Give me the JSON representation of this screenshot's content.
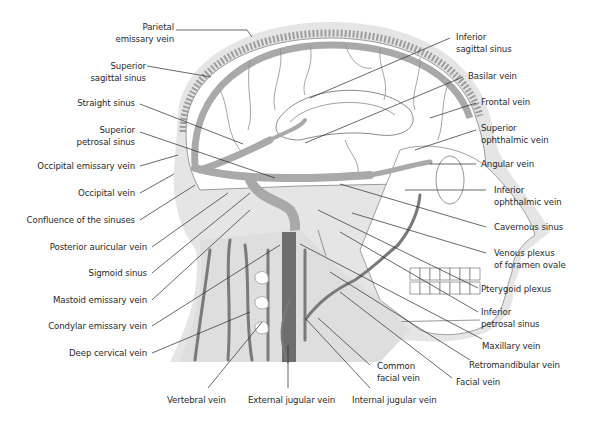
{
  "figure": {
    "colors": {
      "background": "#ffffff",
      "skin_shadow": "#e3e3e3",
      "sinus_gray": "#a9a9a9",
      "dark_vein": "#6e6e6e",
      "leader_line": "#2a2a2a",
      "text": "#2a2a2a"
    }
  },
  "labels_left": [
    {
      "id": "parietal-emissary-vein",
      "lines": [
        "Parietal",
        "emissary vein"
      ]
    },
    {
      "id": "superior-sagittal-sinus",
      "lines": [
        "Superior",
        "sagittal sinus"
      ]
    },
    {
      "id": "straight-sinus",
      "lines": [
        "Straight sinus"
      ]
    },
    {
      "id": "superior-petrosal-sinus",
      "lines": [
        "Superior",
        "petrosal sinus"
      ]
    },
    {
      "id": "occipital-emissary-vein",
      "lines": [
        "Occipital emissary vein"
      ]
    },
    {
      "id": "occipital-vein",
      "lines": [
        "Occipital vein"
      ]
    },
    {
      "id": "confluence-of-the-sinuses",
      "lines": [
        "Confluence of the sinuses"
      ]
    },
    {
      "id": "posterior-auricular-vein",
      "lines": [
        "Posterior auricular vein"
      ]
    },
    {
      "id": "sigmoid-sinus",
      "lines": [
        "Sigmoid sinus"
      ]
    },
    {
      "id": "mastoid-emissary-vein",
      "lines": [
        "Mastoid emissary vein"
      ]
    },
    {
      "id": "condylar-emissary-vein",
      "lines": [
        "Condylar emissary vein"
      ]
    },
    {
      "id": "deep-cervical-vein",
      "lines": [
        "Deep cervical vein"
      ]
    }
  ],
  "labels_right": [
    {
      "id": "inferior-sagittal-sinus",
      "lines": [
        "Inferior",
        "sagittal sinus"
      ]
    },
    {
      "id": "basilar-vein",
      "lines": [
        "Basilar vein"
      ]
    },
    {
      "id": "frontal-vein",
      "lines": [
        "Frontal vein"
      ]
    },
    {
      "id": "superior-ophthalmic-vein",
      "lines": [
        "Superior",
        "ophthalmic vein"
      ]
    },
    {
      "id": "angular-vein",
      "lines": [
        "Angular vein"
      ]
    },
    {
      "id": "inferior-ophthalmic-vein",
      "lines": [
        "Inferior",
        "ophthalmic vein"
      ]
    },
    {
      "id": "cavernous-sinus",
      "lines": [
        "Cavernous sinus"
      ]
    },
    {
      "id": "venous-plexus-of-foramen-ovale",
      "lines": [
        "Venous plexus",
        "of foramen ovale"
      ]
    },
    {
      "id": "pterygoid-plexus",
      "lines": [
        "Pterygoid plexus"
      ]
    },
    {
      "id": "inferior-petrosal-sinus",
      "lines": [
        "Inferior",
        "petrosal sinus"
      ]
    },
    {
      "id": "maxillary-vein",
      "lines": [
        "Maxillary vein"
      ]
    },
    {
      "id": "retromandibular-vein",
      "lines": [
        "Retromandibular vein"
      ]
    },
    {
      "id": "facial-vein",
      "lines": [
        "Facial vein"
      ]
    }
  ],
  "labels_bottom": [
    {
      "id": "common-facial-vein",
      "lines": [
        "Common",
        "facial vein"
      ]
    },
    {
      "id": "vertebral-vein",
      "lines": [
        "Vertebral vein"
      ]
    },
    {
      "id": "external-jugular-vein",
      "lines": [
        "External jugular vein"
      ]
    },
    {
      "id": "internal-jugular-vein",
      "lines": [
        "Internal jugular vein"
      ]
    }
  ]
}
